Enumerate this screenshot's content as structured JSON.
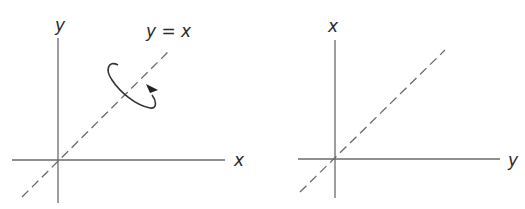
{
  "left_panel": {
    "vertical_axis_label": "y",
    "horizontal_axis_label": "x",
    "line_label": "y = x",
    "rotation_icon": "rotation-arrow-around-line"
  },
  "right_panel": {
    "vertical_axis_label": "x",
    "horizontal_axis_label": "y"
  },
  "colors": {
    "axis": "#6a6a6a",
    "text": "#2a2a2a",
    "background": "#ffffff"
  }
}
